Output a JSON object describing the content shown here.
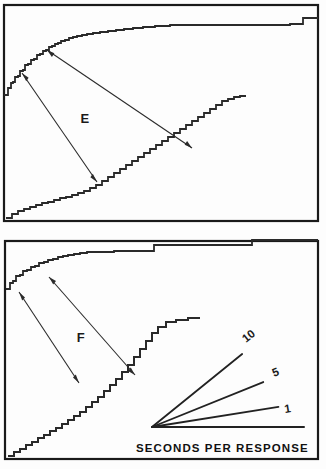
{
  "figure": {
    "background_color": "#fdfdfd",
    "ink_color": "#1f1f1f",
    "width": 326,
    "height": 469
  },
  "panels": [
    {
      "id": "panel-e",
      "letter": "E",
      "letter_position": {
        "x": 85,
        "y": 123
      },
      "frame": {
        "x": 4,
        "y": 5,
        "width": 314,
        "height": 216
      }
    },
    {
      "id": "panel-f",
      "letter": "F",
      "letter_position": {
        "x": 81,
        "y": 342
      },
      "frame": {
        "x": 5,
        "y": 241,
        "width": 313,
        "height": 218
      }
    }
  ],
  "legend": {
    "caption": "SECONDS PER RESPONSE",
    "caption_position": {
      "x": 152,
      "y": 449
    },
    "origin": {
      "x": 152,
      "y": 427
    },
    "rays": [
      {
        "label": "10",
        "angle_deg": -39,
        "length": 116,
        "label_x": 246,
        "label_y": 343,
        "label_rotation": -39
      },
      {
        "label": "5",
        "angle_deg": -22,
        "length": 120,
        "label_x": 274,
        "label_y": 377,
        "label_rotation": -22
      },
      {
        "label": "1",
        "angle_deg": -9,
        "length": 128,
        "label_x": 285,
        "label_y": 413,
        "label_rotation": -9
      },
      {
        "label": "",
        "angle_deg": 0,
        "length": 152,
        "label_x": 0,
        "label_y": 0,
        "label_rotation": 0
      }
    ]
  },
  "chart_data": {
    "type": "line",
    "xlabel": "Time",
    "ylabel": "Cumulative responses",
    "legend_caption": "SECONDS PER RESPONSE",
    "legend_rates": [
      "10",
      "5",
      "1"
    ],
    "grid": false,
    "series": [
      {
        "name": "E-upper",
        "panel": "E",
        "description": "Negatively accelerated cumulative curve, high initial rate flattening to near-zero slope",
        "points": [
          [
            4,
            95
          ],
          [
            8,
            88
          ],
          [
            11,
            83
          ],
          [
            13,
            82
          ],
          [
            15,
            77
          ],
          [
            18,
            76
          ],
          [
            20,
            71
          ],
          [
            23,
            70
          ],
          [
            25,
            65
          ],
          [
            28,
            64
          ],
          [
            31,
            60
          ],
          [
            34,
            59
          ],
          [
            37,
            55
          ],
          [
            40,
            54
          ],
          [
            43,
            51
          ],
          [
            46,
            50
          ],
          [
            49,
            47
          ],
          [
            52,
            46
          ],
          [
            55,
            44
          ],
          [
            58,
            43
          ],
          [
            61,
            41
          ],
          [
            65,
            40
          ],
          [
            69,
            38
          ],
          [
            73,
            37
          ],
          [
            77,
            36
          ],
          [
            82,
            35
          ],
          [
            87,
            34
          ],
          [
            93,
            33
          ],
          [
            100,
            32
          ],
          [
            108,
            31
          ],
          [
            116,
            30
          ],
          [
            124,
            29
          ],
          [
            133,
            28
          ],
          [
            143,
            27
          ],
          [
            155,
            26
          ],
          [
            170,
            25
          ],
          [
            190,
            25
          ],
          [
            215,
            25
          ],
          [
            240,
            25
          ],
          [
            260,
            25
          ],
          [
            276,
            25
          ],
          [
            290,
            24
          ],
          [
            300,
            24
          ],
          [
            303,
            18
          ],
          [
            310,
            18
          ],
          [
            318,
            18
          ]
        ]
      },
      {
        "name": "E-lower",
        "panel": "E",
        "description": "Positively accelerated cumulative staircase rising from bottom-left to mid-right",
        "points": [
          [
            6,
            218
          ],
          [
            12,
            214
          ],
          [
            18,
            211
          ],
          [
            24,
            209
          ],
          [
            30,
            207
          ],
          [
            36,
            205
          ],
          [
            42,
            203
          ],
          [
            48,
            202
          ],
          [
            54,
            200
          ],
          [
            60,
            198
          ],
          [
            66,
            197
          ],
          [
            72,
            195
          ],
          [
            78,
            193
          ],
          [
            84,
            191
          ],
          [
            90,
            188
          ],
          [
            96,
            185
          ],
          [
            102,
            181
          ],
          [
            108,
            177
          ],
          [
            114,
            173
          ],
          [
            120,
            169
          ],
          [
            126,
            165
          ],
          [
            132,
            161
          ],
          [
            138,
            157
          ],
          [
            144,
            153
          ],
          [
            150,
            149
          ],
          [
            156,
            145
          ],
          [
            162,
            141
          ],
          [
            168,
            137
          ],
          [
            174,
            133
          ],
          [
            180,
            129
          ],
          [
            186,
            125
          ],
          [
            192,
            121
          ],
          [
            198,
            117
          ],
          [
            204,
            113
          ],
          [
            210,
            109
          ],
          [
            216,
            105
          ],
          [
            222,
            101
          ],
          [
            228,
            99
          ],
          [
            234,
            97
          ],
          [
            240,
            96
          ],
          [
            246,
            96
          ]
        ]
      },
      {
        "name": "F-upper",
        "panel": "F",
        "description": "Negatively accelerated cumulative curve with discrete step increments",
        "points": [
          [
            6,
            289
          ],
          [
            10,
            283
          ],
          [
            13,
            281
          ],
          [
            16,
            276
          ],
          [
            20,
            275
          ],
          [
            23,
            271
          ],
          [
            27,
            270
          ],
          [
            31,
            267
          ],
          [
            35,
            266
          ],
          [
            39,
            263
          ],
          [
            44,
            262
          ],
          [
            48,
            260
          ],
          [
            53,
            259
          ],
          [
            58,
            257
          ],
          [
            63,
            256
          ],
          [
            68,
            255
          ],
          [
            74,
            254
          ],
          [
            80,
            253
          ],
          [
            87,
            252
          ],
          [
            95,
            252
          ],
          [
            104,
            252
          ],
          [
            114,
            251
          ],
          [
            125,
            251
          ],
          [
            137,
            251
          ],
          [
            150,
            251
          ],
          [
            154,
            245
          ],
          [
            170,
            245
          ],
          [
            190,
            245
          ],
          [
            210,
            245
          ],
          [
            230,
            245
          ],
          [
            248,
            245
          ],
          [
            252,
            240
          ],
          [
            270,
            240
          ],
          [
            290,
            240
          ],
          [
            305,
            240
          ],
          [
            318,
            240
          ]
        ]
      },
      {
        "name": "F-lower",
        "panel": "F",
        "description": "Coarse staircase cumulative curve, accelerating, terminating at a plateau",
        "points": [
          [
            8,
            456
          ],
          [
            14,
            452
          ],
          [
            20,
            449
          ],
          [
            26,
            445
          ],
          [
            32,
            442
          ],
          [
            38,
            438
          ],
          [
            44,
            435
          ],
          [
            50,
            431
          ],
          [
            56,
            428
          ],
          [
            62,
            424
          ],
          [
            68,
            420
          ],
          [
            74,
            416
          ],
          [
            80,
            412
          ],
          [
            86,
            407
          ],
          [
            92,
            402
          ],
          [
            98,
            397
          ],
          [
            104,
            391
          ],
          [
            110,
            385
          ],
          [
            116,
            379
          ],
          [
            122,
            372
          ],
          [
            128,
            365
          ],
          [
            134,
            357
          ],
          [
            140,
            349
          ],
          [
            146,
            341
          ],
          [
            152,
            333
          ],
          [
            158,
            327
          ],
          [
            166,
            322
          ],
          [
            176,
            320
          ],
          [
            188,
            318
          ],
          [
            200,
            318
          ]
        ]
      }
    ]
  },
  "arrows": {
    "panel_e": [
      {
        "name": "e-arrow-long",
        "from": {
          "x": 97,
          "y": 182
        },
        "to": {
          "x": 22,
          "y": 73
        },
        "heads": [
          "to"
        ],
        "double": true
      },
      {
        "name": "e-arrow-diagonal",
        "from": {
          "x": 47,
          "y": 50
        },
        "to": {
          "x": 192,
          "y": 148
        },
        "heads": [
          "both"
        ],
        "double": true
      }
    ],
    "panel_f": [
      {
        "name": "f-arrow-long",
        "from": {
          "x": 79,
          "y": 383
        },
        "to": {
          "x": 19,
          "y": 292
        },
        "heads": [
          "to"
        ],
        "double": true
      },
      {
        "name": "f-arrow-diagonal",
        "from": {
          "x": 49,
          "y": 277
        },
        "to": {
          "x": 135,
          "y": 375
        },
        "heads": [
          "both"
        ],
        "double": true
      }
    ]
  }
}
